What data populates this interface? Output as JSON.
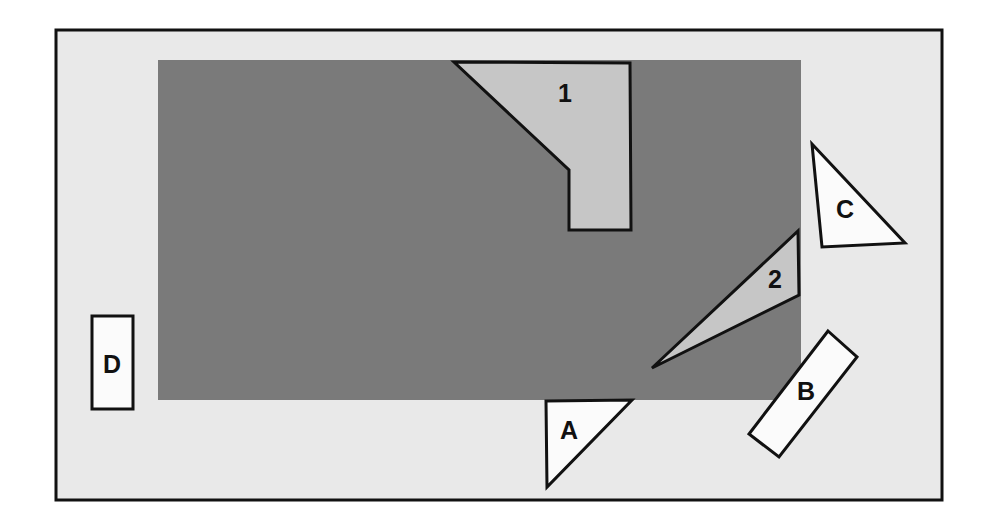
{
  "figure": {
    "canvas": {
      "width": 985,
      "height": 527
    },
    "page_background": "#ffffff",
    "frame": {
      "name": "outer-frame",
      "x": 56,
      "y": 30,
      "width": 886,
      "height": 470,
      "fill": "#e9e9e9",
      "stroke": "#111111",
      "stroke_width": 3
    },
    "base_rectangle": {
      "name": "gray-base-rectangle",
      "x": 158,
      "y": 60,
      "width": 643,
      "height": 340,
      "fill": "#7a7a7a",
      "stroke": "none"
    },
    "colors": {
      "page_background": "#ffffff",
      "frame_fill": "#e9e9e9",
      "base_gray": "#7a7a7a",
      "light_gray_piece": "#c6c6c6",
      "white_piece": "#fbfbfb",
      "outline": "#111111"
    },
    "pieces": [
      {
        "id": "piece-1",
        "label": "1",
        "kind": "polygon",
        "fill": "#c6c6c6",
        "stroke": "#111111",
        "stroke_width": 3,
        "points": "454,62 630,63 631,230 569,230 569,170",
        "label_x": 565,
        "label_y": 95
      },
      {
        "id": "piece-2",
        "label": "2",
        "kind": "polygon",
        "fill": "#c6c6c6",
        "stroke": "#111111",
        "stroke_width": 3,
        "points": "798,231 799,295 652,368",
        "label_x": 775,
        "label_y": 281
      },
      {
        "id": "piece-a",
        "label": "A",
        "kind": "polygon",
        "fill": "#fbfbfb",
        "stroke": "#111111",
        "stroke_width": 3,
        "points": "546,401 632,400 547,487",
        "label_x": 569,
        "label_y": 432
      },
      {
        "id": "piece-b",
        "label": "B",
        "kind": "polygon",
        "fill": "#fbfbfb",
        "stroke": "#111111",
        "stroke_width": 3,
        "points": "828,331 857,357 779,457 749,434",
        "label_x": 806,
        "label_y": 393
      },
      {
        "id": "piece-c",
        "label": "C",
        "kind": "polygon",
        "fill": "#fbfbfb",
        "stroke": "#111111",
        "stroke_width": 3,
        "points": "812,144 905,243 822,247",
        "label_x": 845,
        "label_y": 211
      },
      {
        "id": "piece-d",
        "label": "D",
        "kind": "polygon",
        "fill": "#fbfbfb",
        "stroke": "#111111",
        "stroke_width": 3,
        "points": "92,316 133,316 133,409 92,409",
        "label_x": 112,
        "label_y": 366
      }
    ]
  }
}
